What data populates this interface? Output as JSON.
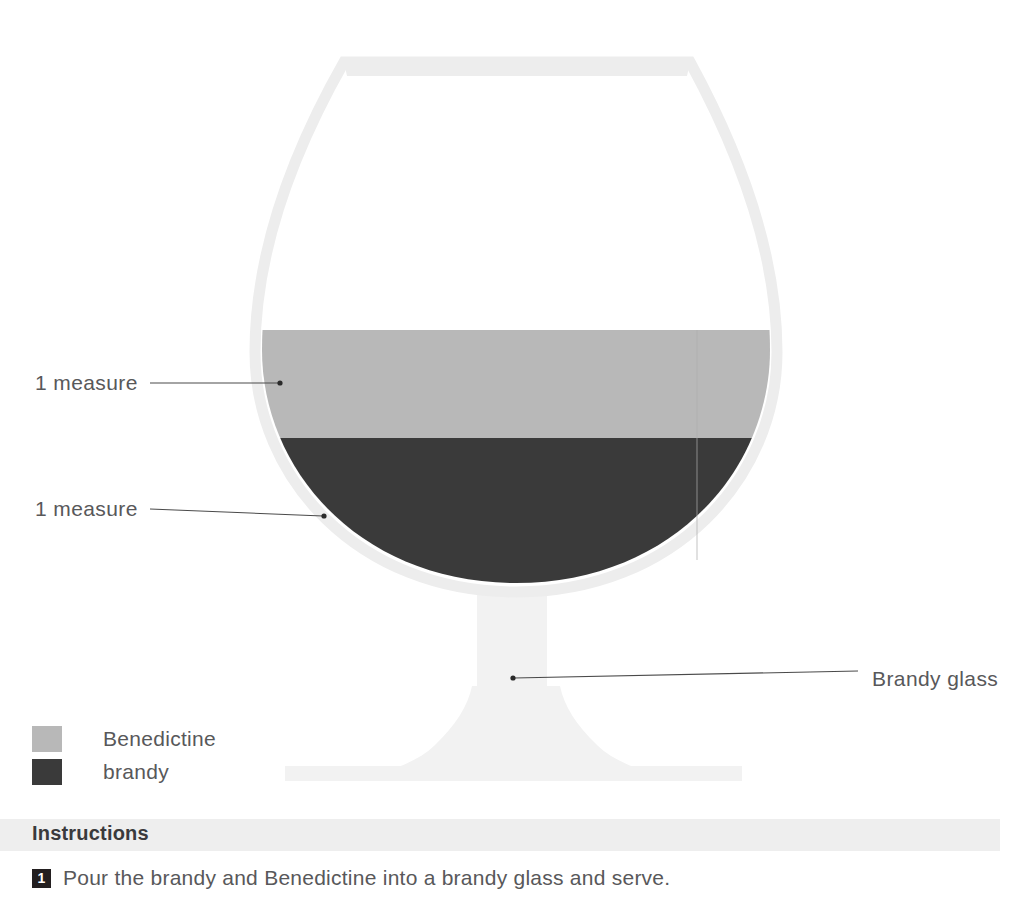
{
  "colors": {
    "glass_outline": "#ededed",
    "glass_body": "#f2f2f2",
    "liquid_top": "#b8b8b8",
    "liquid_bottom": "#3a3a3a",
    "leader_line": "#4a4a4a",
    "text": "#58585a",
    "band": "#eeeeee",
    "badge": "#231f20",
    "page_background": "#ffffff"
  },
  "callouts": {
    "top_measure": "1 measure",
    "bottom_measure": "1 measure",
    "glass_name": "Brandy glass"
  },
  "legend": {
    "items": [
      {
        "label": "Benedictine",
        "color": "#b8b8b8"
      },
      {
        "label": "brandy",
        "color": "#3a3a3a"
      }
    ]
  },
  "instructions": {
    "heading": "Instructions",
    "steps": [
      {
        "number": "1",
        "text": "Pour the brandy and Benedictine into a brandy glass and serve."
      }
    ]
  },
  "diagram": {
    "type": "layered-drink-illustration",
    "glass": "brandy glass",
    "layers": [
      {
        "name": "Benedictine",
        "amount": "1 measure",
        "color": "#b8b8b8",
        "position": "top"
      },
      {
        "name": "brandy",
        "amount": "1 measure",
        "color": "#3a3a3a",
        "position": "bottom"
      }
    ]
  }
}
